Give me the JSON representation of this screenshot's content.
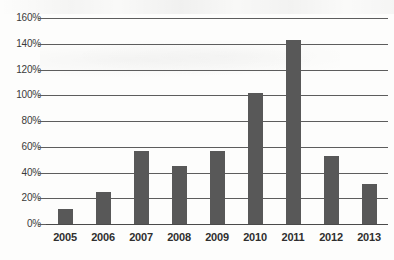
{
  "chart_data": {
    "type": "bar",
    "title": "",
    "subtitle": "",
    "xlabel": "",
    "ylabel": "",
    "categories": [
      "2005",
      "2006",
      "2007",
      "2008",
      "2009",
      "2010",
      "2011",
      "2012",
      "2013"
    ],
    "values": [
      12,
      25,
      57,
      45,
      57,
      102,
      143,
      53,
      31
    ],
    "value_suffix": "%",
    "ylim": [
      0,
      160
    ],
    "y_ticks": [
      0,
      20,
      40,
      60,
      80,
      100,
      120,
      140,
      160
    ],
    "y_tick_labels": [
      "0%",
      "20%",
      "40%",
      "60%",
      "80%",
      "100%",
      "120%",
      "140%",
      "160%"
    ],
    "grid": true,
    "grid_axis": "y",
    "legend": false,
    "legend_position": "none",
    "series": [
      {
        "name": "",
        "values": [
          12,
          25,
          57,
          45,
          57,
          102,
          143,
          53,
          31
        ]
      }
    ],
    "colors": {
      "bar": "#585858",
      "grid": "#5d5d5d",
      "axis": "#4a4a4a",
      "background": "#fdfdfc",
      "tick_label": "#3a3a3a",
      "category_label": "#2f2f2f"
    }
  }
}
